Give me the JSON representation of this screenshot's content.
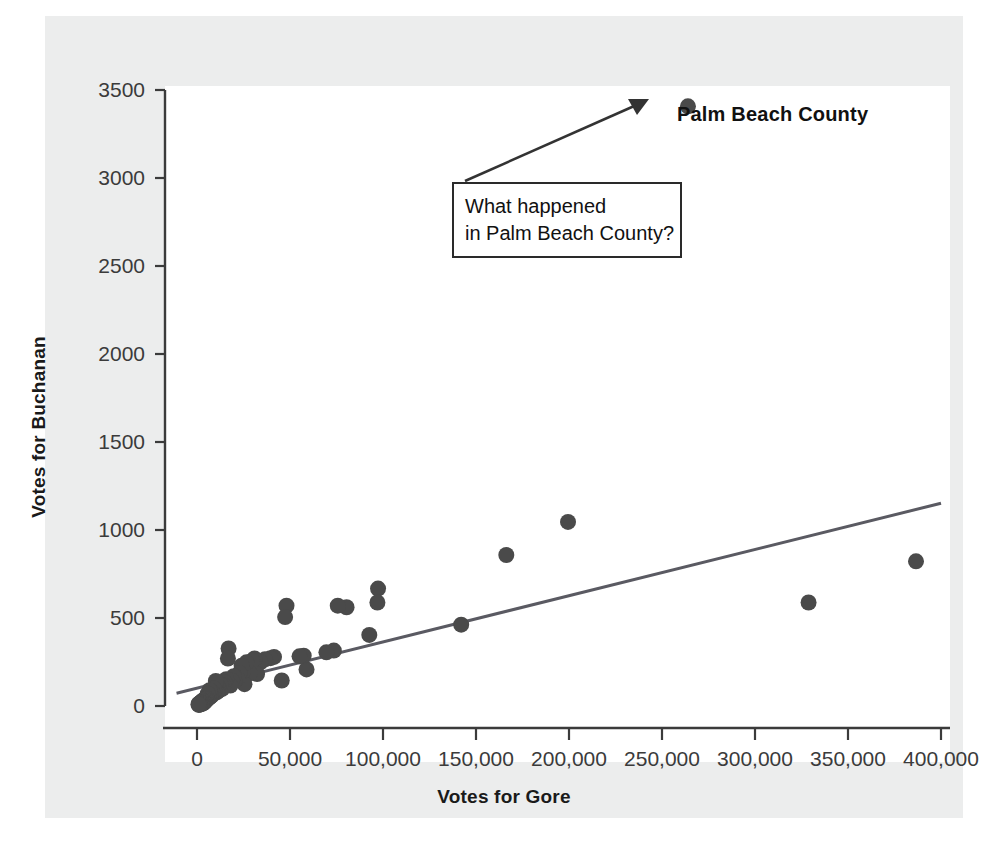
{
  "figure": {
    "background_color": "#eceded",
    "plot_background_color": "#ffffff",
    "axis_color": "#3b3b3b",
    "point_color": "#4a4a4a",
    "line_color": "#5a5a62"
  },
  "axes": {
    "y_title": "Votes for Buchanan",
    "x_title": "Votes for Gore",
    "y_ticks": [
      "0",
      "500",
      "1000",
      "1500",
      "2000",
      "2500",
      "3000",
      "3500"
    ],
    "x_ticks": [
      "0",
      "50,000",
      "100,000",
      "150,000",
      "200,000",
      "250,000",
      "300,000",
      "350,000",
      "400,000"
    ]
  },
  "annotations": {
    "point_label": "Palm Beach County",
    "callout_line1": "What happened",
    "callout_line2": "in Palm Beach County?"
  },
  "chart_data": {
    "type": "scatter",
    "title": "",
    "xlabel": "Votes for Gore",
    "ylabel": "Votes for Buchanan",
    "xlim": [
      -12000,
      412000
    ],
    "ylim": [
      -120,
      3600
    ],
    "xticks": [
      0,
      50000,
      100000,
      150000,
      200000,
      250000,
      300000,
      350000,
      400000
    ],
    "yticks": [
      0,
      500,
      1000,
      1500,
      2000,
      2500,
      3000,
      3500
    ],
    "grid": false,
    "legend": null,
    "series": [
      {
        "name": "Florida counties",
        "marker": "circle",
        "color": "#4a4a4a",
        "points": [
          [
            263945,
            3407
          ],
          [
            386561,
            822
          ],
          [
            328802,
            588
          ],
          [
            199478,
            1046
          ],
          [
            166289,
            858
          ],
          [
            142037,
            462
          ],
          [
            97341,
            667
          ],
          [
            96988,
            588
          ],
          [
            92630,
            404
          ],
          [
            80416,
            561
          ],
          [
            75677,
            570
          ],
          [
            73572,
            315
          ],
          [
            69576,
            305
          ],
          [
            58888,
            208
          ],
          [
            57373,
            286
          ],
          [
            55118,
            282
          ],
          [
            48117,
            570
          ],
          [
            47370,
            505
          ],
          [
            45557,
            145
          ],
          [
            41402,
            279
          ],
          [
            39497,
            272
          ],
          [
            36571,
            265
          ],
          [
            34124,
            248
          ],
          [
            32310,
            182
          ],
          [
            30943,
            270
          ],
          [
            29645,
            257
          ],
          [
            28350,
            186
          ],
          [
            26619,
            248
          ],
          [
            25525,
            124
          ],
          [
            24821,
            199
          ],
          [
            23983,
            229
          ],
          [
            22871,
            187
          ],
          [
            21673,
            157
          ],
          [
            20196,
            145
          ],
          [
            19769,
            169
          ],
          [
            18850,
            143
          ],
          [
            17898,
            116
          ],
          [
            16978,
            327
          ],
          [
            16619,
            270
          ],
          [
            15739,
            152
          ],
          [
            14891,
            134
          ],
          [
            14144,
            118
          ],
          [
            13568,
            98
          ],
          [
            12785,
            120
          ],
          [
            12122,
            90
          ],
          [
            11372,
            105
          ],
          [
            10969,
            83
          ],
          [
            10547,
            77
          ],
          [
            10129,
            142
          ],
          [
            9634,
            89
          ],
          [
            9138,
            100
          ],
          [
            8689,
            68
          ],
          [
            8348,
            75
          ],
          [
            7871,
            59
          ],
          [
            7465,
            64
          ],
          [
            7104,
            52
          ],
          [
            6774,
            90
          ],
          [
            6443,
            47
          ],
          [
            6123,
            56
          ],
          [
            5803,
            70
          ],
          [
            5501,
            38
          ],
          [
            5206,
            45
          ],
          [
            4921,
            33
          ],
          [
            4644,
            29
          ],
          [
            4383,
            41
          ],
          [
            4120,
            22
          ],
          [
            3865,
            35
          ],
          [
            3624,
            19
          ],
          [
            3393,
            26
          ],
          [
            3145,
            14
          ],
          [
            2912,
            30
          ],
          [
            2670,
            17
          ],
          [
            2440,
            23
          ],
          [
            2212,
            11
          ],
          [
            1988,
            20
          ],
          [
            1769,
            9
          ],
          [
            1555,
            16
          ],
          [
            1350,
            8
          ],
          [
            1150,
            13
          ],
          [
            960,
            6
          ],
          [
            780,
            10
          ]
        ]
      }
    ],
    "trend_line": {
      "type": "linear-fit",
      "color": "#5a5a62",
      "x_start": -11000,
      "y_start": 72,
      "x_end": 400000,
      "y_end": 1152
    },
    "annotations": [
      {
        "kind": "point-label",
        "text": "Palm Beach County",
        "x": 263945,
        "y": 3407
      },
      {
        "kind": "callout-box-with-arrow",
        "text": "What happened\nin Palm Beach County?",
        "points_to_x": 263945,
        "points_to_y": 3407
      }
    ]
  }
}
